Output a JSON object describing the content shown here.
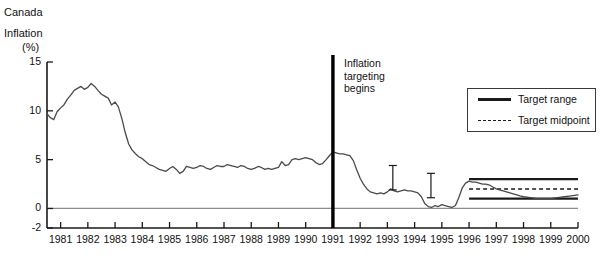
{
  "title": {
    "line1": "Canada",
    "line2": "Inflation",
    "line3": "(%)"
  },
  "annotation": {
    "line1": "Inflation",
    "line2": "targeting",
    "line3": "begins",
    "year": 1991
  },
  "legend": {
    "items": [
      {
        "label": "Target range",
        "style": "solid",
        "color": "#1a1a1a"
      },
      {
        "label": "Target midpoint",
        "style": "dashed",
        "color": "#1a1a1a"
      }
    ]
  },
  "colors": {
    "series": "#4a4a4a",
    "axis": "#1a1a1a",
    "zero_line": "#8c8c8c",
    "target": "#1a1a1a",
    "marker": "#1a1a1a"
  },
  "chart_data": {
    "type": "line",
    "title": "Canada Inflation (%)",
    "xlabel": "",
    "ylabel": "Inflation (%)",
    "xlim": [
      1980.5,
      2000.0
    ],
    "ylim": [
      -2,
      15
    ],
    "yticks": [
      -2,
      0,
      5,
      10,
      15
    ],
    "ytick_labels": [
      "-2",
      "0",
      "5",
      "10",
      "15"
    ],
    "xticks": [
      1981,
      1982,
      1983,
      1984,
      1985,
      1986,
      1987,
      1988,
      1989,
      1990,
      1991,
      1992,
      1993,
      1994,
      1995,
      1996,
      1997,
      1998,
      1999,
      2000
    ],
    "xtick_labels": [
      "1981",
      "1982",
      "1983",
      "1984",
      "1985",
      "1986",
      "1987",
      "1988",
      "1989",
      "1990",
      "1991",
      "1992",
      "1993",
      "1994",
      "1995",
      "1996",
      "1997",
      "1998",
      "1999",
      "2000"
    ],
    "grid": false,
    "legend_position": "upper-right",
    "series": [
      {
        "name": "Canada CPI inflation",
        "style": "solid",
        "x": [
          1980.5,
          1980.62,
          1980.75,
          1980.87,
          1981.0,
          1981.12,
          1981.25,
          1981.37,
          1981.5,
          1981.62,
          1981.75,
          1981.87,
          1982.0,
          1982.12,
          1982.25,
          1982.37,
          1982.5,
          1982.62,
          1982.75,
          1982.87,
          1983.0,
          1983.12,
          1983.25,
          1983.37,
          1983.5,
          1983.62,
          1983.75,
          1983.87,
          1984.0,
          1984.12,
          1984.25,
          1984.37,
          1984.5,
          1984.62,
          1984.75,
          1984.87,
          1985.0,
          1985.12,
          1985.25,
          1985.37,
          1985.5,
          1985.62,
          1985.75,
          1985.87,
          1986.0,
          1986.12,
          1986.25,
          1986.37,
          1986.5,
          1986.62,
          1986.75,
          1986.87,
          1987.0,
          1987.12,
          1987.25,
          1987.37,
          1987.5,
          1987.62,
          1987.75,
          1987.87,
          1988.0,
          1988.12,
          1988.25,
          1988.37,
          1988.5,
          1988.62,
          1988.75,
          1988.87,
          1989.0,
          1989.12,
          1989.25,
          1989.37,
          1989.5,
          1989.62,
          1989.75,
          1989.87,
          1990.0,
          1990.12,
          1990.25,
          1990.37,
          1990.5,
          1990.62,
          1990.75,
          1990.87,
          1991.0,
          1991.12,
          1991.25,
          1991.37,
          1991.5,
          1991.62,
          1991.75,
          1991.87,
          1992.0,
          1992.12,
          1992.25,
          1992.37,
          1992.5,
          1992.62,
          1992.75,
          1992.87,
          1993.0,
          1993.12,
          1993.25,
          1993.37,
          1993.5,
          1993.62,
          1993.75,
          1993.87,
          1994.0,
          1994.12,
          1994.25,
          1994.37,
          1994.5,
          1994.62,
          1994.75,
          1994.87,
          1995.0,
          1995.12,
          1995.25,
          1995.37,
          1995.5,
          1995.62,
          1995.75,
          1995.87,
          1996.0,
          1996.12,
          1996.25,
          1996.37,
          1996.5,
          1996.62,
          1996.75,
          1996.87,
          1997.0,
          1997.12,
          1997.25,
          1997.37,
          1997.5,
          1997.62,
          1997.75,
          1997.87,
          1998.0,
          1998.25,
          1998.5,
          1998.75,
          1999.0,
          1999.25,
          1999.5,
          1999.75,
          2000.0
        ],
        "y": [
          9.7,
          9.3,
          9.1,
          9.9,
          10.3,
          10.6,
          11.2,
          11.6,
          12.1,
          12.3,
          12.5,
          12.2,
          12.4,
          12.8,
          12.5,
          12.1,
          11.7,
          11.5,
          11.3,
          10.6,
          10.9,
          10.4,
          9.2,
          7.8,
          6.6,
          6.0,
          5.6,
          5.3,
          5.1,
          4.8,
          4.5,
          4.4,
          4.2,
          4.0,
          3.9,
          3.8,
          4.1,
          4.3,
          4.0,
          3.6,
          3.8,
          4.3,
          4.2,
          4.1,
          4.2,
          4.4,
          4.3,
          4.1,
          4.0,
          4.2,
          4.4,
          4.3,
          4.3,
          4.5,
          4.4,
          4.3,
          4.2,
          4.4,
          4.3,
          4.1,
          4.0,
          4.1,
          4.3,
          4.2,
          4.0,
          4.1,
          4.0,
          4.1,
          4.2,
          4.8,
          4.4,
          4.5,
          5.0,
          5.1,
          5.0,
          5.1,
          5.2,
          5.1,
          5.0,
          4.7,
          4.5,
          4.6,
          5.0,
          5.4,
          5.8,
          5.7,
          5.6,
          5.6,
          5.5,
          5.4,
          4.9,
          4.0,
          3.1,
          2.5,
          2.0,
          1.7,
          1.6,
          1.5,
          1.6,
          1.5,
          1.7,
          2.0,
          1.8,
          1.7,
          1.8,
          1.9,
          1.8,
          1.8,
          1.7,
          1.6,
          1.2,
          0.5,
          0.2,
          0.1,
          0.3,
          0.2,
          0.4,
          0.3,
          0.2,
          0.1,
          0.3,
          1.1,
          2.1,
          2.6,
          2.8,
          2.7,
          2.7,
          2.6,
          2.5,
          2.5,
          2.4,
          2.2,
          2.0,
          1.9,
          1.8,
          1.7,
          1.6,
          1.5,
          1.4,
          1.3,
          1.2,
          1.1,
          1.0,
          1.0,
          1.0,
          1.1,
          1.2,
          1.3,
          1.4
        ]
      }
    ],
    "target_band": {
      "start": 1996.0,
      "end": 2000.0,
      "upper": 3.0,
      "lower": 1.0,
      "midpoint": 2.0,
      "upper_label": "Target range",
      "midpoint_label": "Target midpoint"
    },
    "markers": [
      {
        "x": 1993.2,
        "low": 1.9,
        "high": 4.4,
        "type": "i-bar"
      },
      {
        "x": 1994.6,
        "low": 1.1,
        "high": 3.6,
        "type": "i-bar"
      }
    ],
    "annotations": [
      {
        "x": 1991.0,
        "text": "Inflation targeting begins",
        "type": "vertical-rule"
      }
    ]
  }
}
